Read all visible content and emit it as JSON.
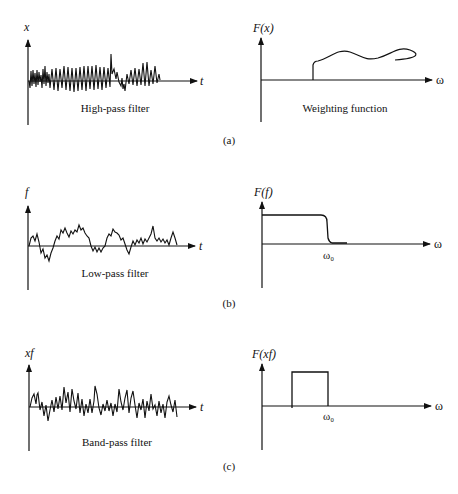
{
  "figure": {
    "panels": [
      {
        "id": "a",
        "caption": "(a)",
        "time_plot": {
          "y_label": "x",
          "x_label": "t",
          "title": "High-pass filter"
        },
        "freq_plot": {
          "y_label": "F(x)",
          "x_label": "ω",
          "title": "Weighting function"
        }
      },
      {
        "id": "b",
        "caption": "(b)",
        "time_plot": {
          "y_label": "f",
          "x_label": "t",
          "title": "Low-pass filter"
        },
        "freq_plot": {
          "y_label": "F(f)",
          "x_label": "ω",
          "cutoff_label": "ω₀"
        }
      },
      {
        "id": "c",
        "caption": "(c)",
        "time_plot": {
          "y_label": "xf",
          "x_label": "t",
          "title": "Band-pass filter"
        },
        "freq_plot": {
          "y_label": "F(xf)",
          "x_label": "ω",
          "cutoff_label": "ω₀"
        }
      }
    ]
  }
}
